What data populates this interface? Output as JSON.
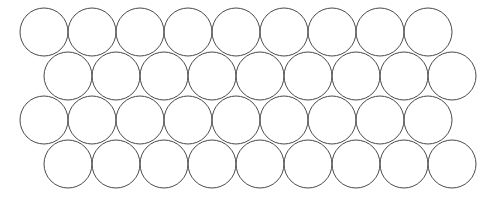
{
  "figure": {
    "name": "hexagonal-circle-packing",
    "type": "geometric-diagram",
    "canvas": {
      "width": 484,
      "height": 199,
      "background_color": "#ffffff"
    },
    "style": {
      "stroke_color": "#4a4a4a",
      "stroke_width": 1,
      "fill": "none"
    }
  },
  "chart_data": {
    "type": "scatter",
    "title": "",
    "subtitle": "",
    "xlabel": "",
    "ylabel": "",
    "grid": false,
    "legend": null,
    "xlim": [
      0,
      484
    ],
    "ylim": [
      0,
      199
    ],
    "marker": {
      "shape": "circle",
      "radius": 24,
      "diameter": 48,
      "fill": "none",
      "edge_color": "#4a4a4a",
      "edge_width": 1
    },
    "lattice": {
      "packing": "hexagonal-close-packed",
      "rows": 4,
      "columns_per_row": 9,
      "total_circles": 36,
      "horizontal_pitch": 48,
      "vertical_pitch": 44,
      "row_offset": 24,
      "first_row_center_x": 44,
      "first_row_center_y": 32
    },
    "rows": [
      {
        "index": 1,
        "center_y": 32,
        "offset": 0,
        "count": 9,
        "x": [
          44,
          92,
          140,
          188,
          236,
          284,
          332,
          380,
          428
        ],
        "x_extent": [
          20,
          452
        ]
      },
      {
        "index": 2,
        "center_y": 76,
        "offset": 24,
        "count": 9,
        "x": [
          68,
          116,
          164,
          212,
          260,
          308,
          356,
          404,
          452
        ],
        "x_extent": [
          44,
          476
        ]
      },
      {
        "index": 3,
        "center_y": 120,
        "offset": 0,
        "count": 9,
        "x": [
          44,
          92,
          140,
          188,
          236,
          284,
          332,
          380,
          428
        ],
        "x_extent": [
          20,
          452
        ]
      },
      {
        "index": 4,
        "center_y": 164,
        "offset": 24,
        "count": 9,
        "x": [
          68,
          116,
          164,
          212,
          260,
          308,
          356,
          404,
          452
        ],
        "x_extent": [
          44,
          476
        ]
      }
    ]
  }
}
